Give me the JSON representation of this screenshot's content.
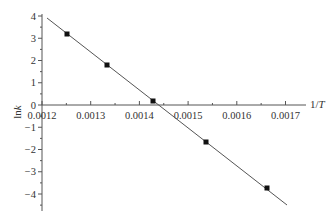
{
  "chart_data": {
    "type": "scatter",
    "title": "",
    "xlabel": "1/T",
    "ylabel": "lnk",
    "xlim": [
      0.0012,
      0.00175
    ],
    "ylim": [
      -4.5,
      4
    ],
    "grid": false,
    "legend": null,
    "x_ticks": [
      "0.0012",
      "0.0013",
      "0.0014",
      "0.0015",
      "0.0016",
      "0.0017"
    ],
    "y_ticks": [
      "4",
      "3",
      "2",
      "1",
      "0",
      "-1",
      "-2",
      "-3",
      "-4"
    ],
    "series": [
      {
        "name": "data",
        "marker": "square",
        "points": [
          {
            "x": 0.00125,
            "y": 3.15
          },
          {
            "x": 0.00133,
            "y": 1.8
          },
          {
            "x": 0.00143,
            "y": 0.25
          },
          {
            "x": 0.00154,
            "y": -1.5
          },
          {
            "x": 0.00166,
            "y": -3.6
          }
        ]
      },
      {
        "name": "linear fit",
        "type": "line",
        "points": [
          {
            "x": 0.00121,
            "y": 3.9
          },
          {
            "x": 0.00171,
            "y": -4.5
          }
        ]
      }
    ],
    "colors": {
      "axis": "#555555",
      "line": "#555555",
      "marker": "#111111"
    }
  }
}
